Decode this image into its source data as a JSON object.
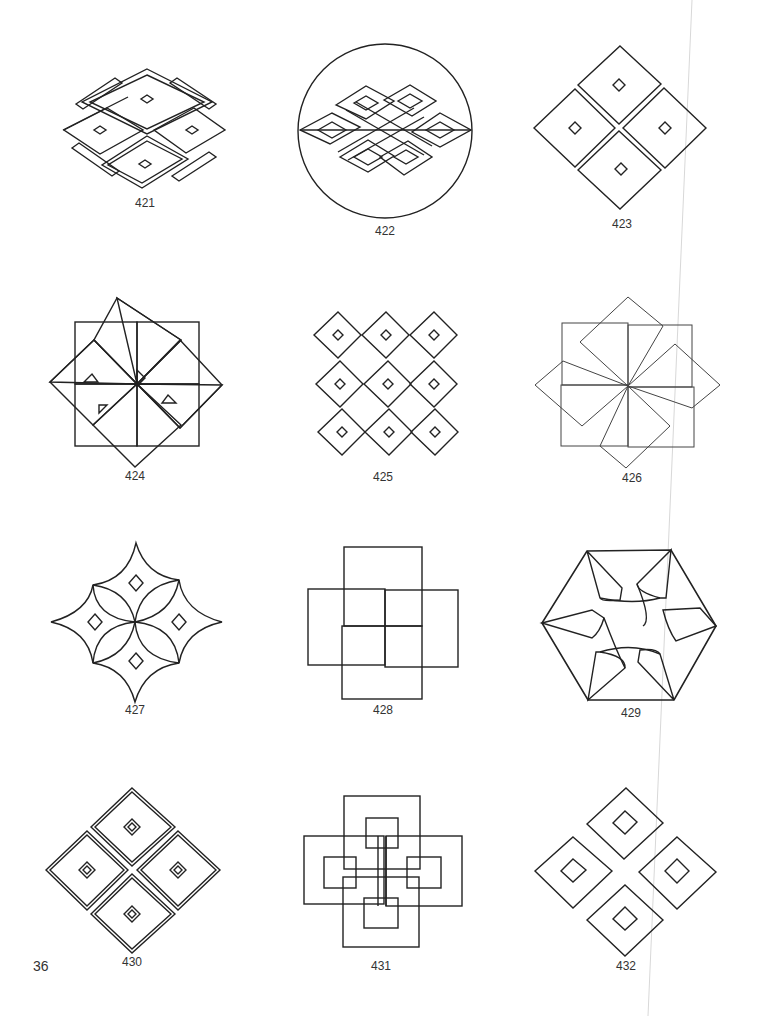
{
  "page": {
    "page_number": "36",
    "figures": [
      {
        "id": "421",
        "label": "421",
        "description": "four framed diamonds with small central diamonds and four L-shaped bars"
      },
      {
        "id": "422",
        "label": "422",
        "description": "endless knot inside a circle"
      },
      {
        "id": "423",
        "label": "423",
        "description": "four diamonds arranged in a larger diamond, each with small centre diamond"
      },
      {
        "id": "424",
        "label": "424",
        "description": "eight overlapping squares rotating around a centre point"
      },
      {
        "id": "425",
        "label": "425",
        "description": "3x3 lattice of diamonds each with small centre diamond"
      },
      {
        "id": "426",
        "label": "426",
        "description": "eight overlapping squares forming a pinwheel"
      },
      {
        "id": "427",
        "label": "427",
        "description": "curved four-pointed star with petal arcs and four small diamonds"
      },
      {
        "id": "428",
        "label": "428",
        "description": "four interlocking rectangles forming a swastika-like fret"
      },
      {
        "id": "429",
        "label": "429",
        "description": "hexagon with six curved kite shapes"
      },
      {
        "id": "430",
        "label": "430",
        "description": "four double-line framed diamonds with concentric centres"
      },
      {
        "id": "431",
        "label": "431",
        "description": "interlaced rectangles forming a cross knot"
      },
      {
        "id": "432",
        "label": "432",
        "description": "four separated diamonds each with inner diamond"
      }
    ]
  }
}
